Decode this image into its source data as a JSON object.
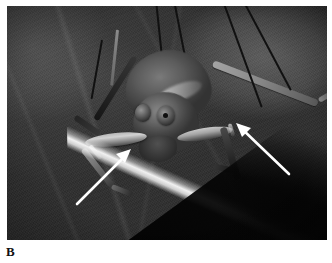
{
  "figure": {
    "panel_label": "B",
    "caption_text": "",
    "modality": "grayscale macro photograph"
  },
  "photo": {
    "subject": "katydid (bush cricket) resting on a leaf",
    "background_description": "dark out-of-focus foliage",
    "leaf_description": "broad dark leaf with bright illuminated edge running diagonally",
    "colors": {
      "paper": "#ffffff",
      "photo_dark": "#2e2e2c",
      "photo_mid": "#4a4a45",
      "highlight": "#d2cec0",
      "arrow": "#ffffff",
      "label_text": "#111111"
    }
  },
  "annotations": {
    "arrows": [
      {
        "id": "arrow-left",
        "label": "left foreleg tympanal organ",
        "direction": "up-right",
        "tail": {
          "x": 22,
          "y": 60
        },
        "head": {
          "x": 74,
          "y": 10
        }
      },
      {
        "id": "arrow-right",
        "label": "right foreleg tympanal organ",
        "direction": "up-left",
        "tail": {
          "x": 66,
          "y": 58
        },
        "head": {
          "x": 12,
          "y": 8
        }
      }
    ],
    "arrow_count": 2
  },
  "insect": {
    "parts": [
      {
        "name": "head"
      },
      {
        "name": "compound-eye-left"
      },
      {
        "name": "compound-eye-right"
      },
      {
        "name": "pronotum"
      },
      {
        "name": "mouthparts"
      },
      {
        "name": "foreleg-left"
      },
      {
        "name": "foreleg-right"
      },
      {
        "name": "antenna"
      }
    ]
  }
}
